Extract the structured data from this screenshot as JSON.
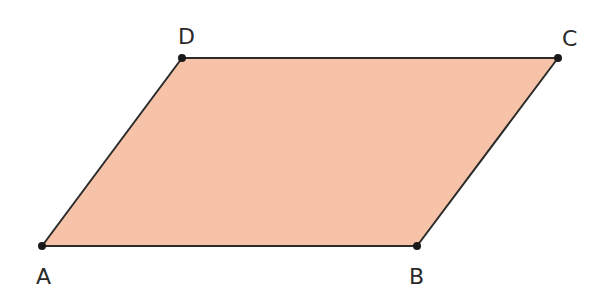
{
  "diagram": {
    "type": "parallelogram",
    "fill_color": "#f6c3a8",
    "stroke_color": "#2b2b2b",
    "vertices": [
      {
        "name": "A",
        "x": 42,
        "y": 246,
        "label_x": 36,
        "label_y": 284
      },
      {
        "name": "B",
        "x": 417,
        "y": 246,
        "label_x": 409,
        "label_y": 284
      },
      {
        "name": "C",
        "x": 558,
        "y": 58,
        "label_x": 562,
        "label_y": 46
      },
      {
        "name": "D",
        "x": 182,
        "y": 58,
        "label_x": 178,
        "label_y": 44
      }
    ]
  }
}
